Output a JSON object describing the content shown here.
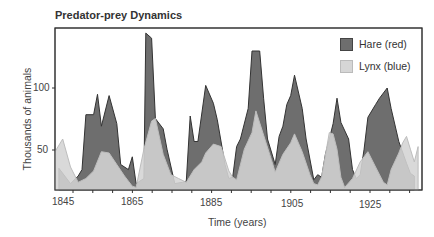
{
  "chart_data": {
    "type": "area",
    "title": "Predator-prey Dynamics",
    "xlabel": "Time (years)",
    "ylabel": "Thousands of animals",
    "x_ticks": [
      "1845",
      "1865",
      "1885",
      "1905",
      "1925"
    ],
    "y_ticks": [
      "50",
      "100"
    ],
    "xlim": [
      1843,
      1938
    ],
    "ylim": [
      18,
      145
    ],
    "grid": false,
    "legend_position": "upper right",
    "series": [
      {
        "name": "Hare (red)",
        "color": "#6e6e6e",
        "points": [
          [
            1844,
            35
          ],
          [
            1847,
            23
          ],
          [
            1849,
            29
          ],
          [
            1850,
            34
          ],
          [
            1851,
            77
          ],
          [
            1853,
            77
          ],
          [
            1854,
            93
          ],
          [
            1855,
            68
          ],
          [
            1857,
            92
          ],
          [
            1859,
            70
          ],
          [
            1860,
            38
          ],
          [
            1862,
            34
          ],
          [
            1863,
            44
          ],
          [
            1864,
            23
          ],
          [
            1866,
            27
          ],
          [
            1866.5,
            141
          ],
          [
            1868,
            137
          ],
          [
            1869,
            74
          ],
          [
            1871,
            66
          ],
          [
            1872,
            50
          ],
          [
            1874,
            23
          ],
          [
            1876,
            24
          ],
          [
            1877,
            25
          ],
          [
            1878,
            76
          ],
          [
            1879,
            56
          ],
          [
            1880,
            56
          ],
          [
            1882,
            100
          ],
          [
            1884,
            86
          ],
          [
            1885,
            73
          ],
          [
            1887,
            38
          ],
          [
            1888,
            27
          ],
          [
            1889,
            28
          ],
          [
            1890,
            52
          ],
          [
            1891,
            58
          ],
          [
            1893,
            82
          ],
          [
            1894,
            127
          ],
          [
            1896,
            127
          ],
          [
            1897,
            90
          ],
          [
            1898,
            58
          ],
          [
            1900,
            38
          ],
          [
            1901,
            60
          ],
          [
            1902,
            68
          ],
          [
            1903,
            85
          ],
          [
            1904,
            92
          ],
          [
            1905,
            108
          ],
          [
            1907,
            82
          ],
          [
            1908,
            58
          ],
          [
            1910,
            26
          ],
          [
            1911,
            30
          ],
          [
            1912,
            28
          ],
          [
            1913,
            46
          ],
          [
            1914,
            58
          ],
          [
            1915,
            70
          ],
          [
            1916,
            90
          ],
          [
            1917,
            71
          ],
          [
            1919,
            58
          ],
          [
            1920,
            34
          ],
          [
            1921,
            27
          ],
          [
            1922,
            30
          ],
          [
            1923,
            50
          ],
          [
            1924,
            75
          ],
          [
            1926,
            85
          ],
          [
            1927,
            90
          ],
          [
            1929,
            98
          ],
          [
            1930,
            82
          ],
          [
            1932,
            56
          ],
          [
            1934,
            39
          ],
          [
            1935,
            31
          ],
          [
            1936,
            29
          ]
        ]
      },
      {
        "name": "Lynx (blue)",
        "color": "#d4d4d4",
        "points": [
          [
            1843,
            48
          ],
          [
            1845,
            58
          ],
          [
            1847,
            36
          ],
          [
            1849,
            24
          ],
          [
            1851,
            27
          ],
          [
            1853,
            33
          ],
          [
            1855,
            48
          ],
          [
            1857,
            47
          ],
          [
            1859,
            38
          ],
          [
            1861,
            29
          ],
          [
            1863,
            21
          ],
          [
            1864,
            20
          ],
          [
            1866,
            50
          ],
          [
            1868,
            72
          ],
          [
            1869,
            74
          ],
          [
            1871,
            46
          ],
          [
            1873,
            30
          ],
          [
            1875,
            27
          ],
          [
            1877,
            24
          ],
          [
            1879,
            34
          ],
          [
            1881,
            40
          ],
          [
            1882,
            47
          ],
          [
            1884,
            54
          ],
          [
            1886,
            52
          ],
          [
            1888,
            33
          ],
          [
            1889,
            28
          ],
          [
            1890,
            26
          ],
          [
            1892,
            50
          ],
          [
            1894,
            63
          ],
          [
            1895,
            80
          ],
          [
            1897,
            61
          ],
          [
            1899,
            42
          ],
          [
            1900,
            32
          ],
          [
            1902,
            46
          ],
          [
            1904,
            55
          ],
          [
            1905,
            62
          ],
          [
            1907,
            48
          ],
          [
            1909,
            30
          ],
          [
            1910,
            23
          ],
          [
            1911,
            22
          ],
          [
            1912,
            28
          ],
          [
            1914,
            63
          ],
          [
            1915,
            62
          ],
          [
            1916,
            50
          ],
          [
            1917,
            28
          ],
          [
            1918,
            20
          ],
          [
            1920,
            27
          ],
          [
            1922,
            40
          ],
          [
            1924,
            48
          ],
          [
            1926,
            36
          ],
          [
            1928,
            24
          ],
          [
            1929,
            22
          ],
          [
            1930,
            34
          ],
          [
            1932,
            47
          ],
          [
            1933,
            55
          ],
          [
            1934,
            60
          ],
          [
            1935,
            50
          ],
          [
            1936,
            40
          ],
          [
            1937,
            52
          ]
        ]
      }
    ]
  },
  "legend": {
    "items": [
      {
        "label": "Hare (red)",
        "color": "#6e6e6e"
      },
      {
        "label": "Lynx (blue)",
        "color": "#d6d6d6"
      }
    ]
  }
}
